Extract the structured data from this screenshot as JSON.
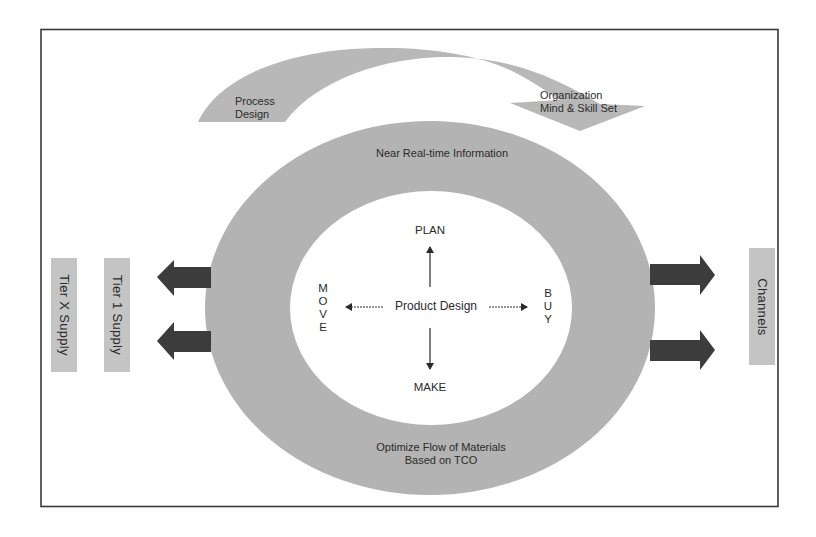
{
  "diagram": {
    "top_arrow": {
      "left_label": [
        "Process",
        "Design"
      ],
      "right_label": [
        "Organization",
        "Mind & Skill Set"
      ]
    },
    "ring": {
      "top_label": "Near Real-time Information",
      "bottom_label": [
        "Optimize Flow of Materials",
        "Based on TCO"
      ]
    },
    "center": {
      "label": "Product Design",
      "up": "PLAN",
      "down": "MAKE",
      "left": [
        "M",
        "O",
        "V",
        "E"
      ],
      "right": [
        "B",
        "U",
        "Y"
      ]
    },
    "left_boxes": [
      {
        "label": "Tier X Supply"
      },
      {
        "label": "Tier 1 Supply"
      }
    ],
    "right_boxes": [
      {
        "label": "Channels"
      }
    ],
    "colors": {
      "frame": "#3a3a3a",
      "ring_fill": "#b3b3b3",
      "band_fill": "#b8b8b8",
      "box_fill": "#c4c4c4",
      "arrow_fill": "#3c3c3c",
      "text": "#2b2b2b"
    }
  }
}
